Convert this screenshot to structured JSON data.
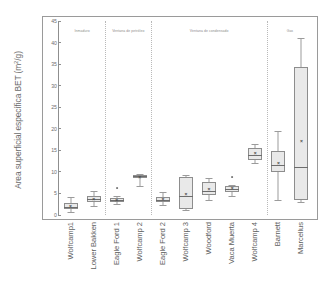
{
  "chart_data": {
    "type": "box",
    "title": "",
    "xlabel": "",
    "ylabel": "Area superficial específica BET (m²/g)",
    "ylabel_main": "Area superficial específica BET (m",
    "ylabel_sup": "2",
    "ylabel_tail": "/g)",
    "ylim": [
      0,
      45
    ],
    "ytick_labels": [
      "45",
      "40",
      "35",
      "30",
      "25",
      "20",
      "15",
      "10",
      "5",
      "0"
    ],
    "ytick_values": [
      45,
      40,
      35,
      30,
      25,
      20,
      15,
      10,
      5,
      0
    ],
    "grid": false,
    "legend": "none",
    "categories": [
      "Wolfcamp1",
      "Lower Bakken",
      "Eagle Ford 1",
      "Wolfcamp 2",
      "Eagle Ford 2",
      "Wolfcamp 3",
      "Woodford",
      "Vaca Muerta",
      "Wolfcamp 4",
      "Barnett",
      "Marcellus"
    ],
    "groups": [
      {
        "label": "Inmaduro",
        "start": 0,
        "end": 1
      },
      {
        "label": "Ventana de petróleo",
        "start": 2,
        "end": 3
      },
      {
        "label": "Ventana de condensado",
        "start": 4,
        "end": 8
      },
      {
        "label": "Gas",
        "start": 9,
        "end": 10
      }
    ],
    "boxes": [
      {
        "category": "Wolfcamp1",
        "whisker_low": 0.8,
        "q1": 1.3,
        "median": 1.9,
        "mean": 2.0,
        "q3": 2.7,
        "whisker_high": 4.2,
        "outliers": []
      },
      {
        "category": "Lower Bakken",
        "whisker_low": 2.2,
        "q1": 3.1,
        "median": 3.6,
        "mean": 3.8,
        "q3": 4.3,
        "whisker_high": 5.6,
        "outliers": []
      },
      {
        "category": "Eagle Ford 1",
        "whisker_low": 2.6,
        "q1": 3.0,
        "median": 3.4,
        "mean": 3.5,
        "q3": 3.9,
        "whisker_high": 4.3,
        "outliers": [
          6.2
        ]
      },
      {
        "category": "Wolfcamp 2",
        "whisker_low": 6.8,
        "q1": 8.6,
        "median": 9.0,
        "mean": 8.8,
        "q3": 9.3,
        "whisker_high": 9.6,
        "outliers": []
      },
      {
        "category": "Eagle Ford 2",
        "whisker_low": 2.3,
        "q1": 3.0,
        "median": 3.5,
        "mean": 3.6,
        "q3": 4.2,
        "whisker_high": 5.3,
        "outliers": []
      },
      {
        "category": "Wolfcamp 3",
        "whisker_low": 1.1,
        "q1": 1.3,
        "median": 4.4,
        "mean": 4.8,
        "q3": 8.9,
        "whisker_high": 9.3,
        "outliers": []
      },
      {
        "category": "Woodford",
        "whisker_low": 3.5,
        "q1": 4.6,
        "median": 5.6,
        "mean": 6.1,
        "q3": 7.7,
        "whisker_high": 8.5,
        "outliers": []
      },
      {
        "category": "Vaca Muerta",
        "whisker_low": 4.5,
        "q1": 5.4,
        "median": 6.1,
        "mean": 6.3,
        "q3": 6.7,
        "whisker_high": 7.0,
        "outliers": [
          8.8
        ]
      },
      {
        "category": "Wolfcamp 4",
        "whisker_low": 12.0,
        "q1": 12.8,
        "median": 13.9,
        "mean": 14.4,
        "q3": 15.6,
        "whisker_high": 16.4,
        "outliers": []
      },
      {
        "category": "Barnett",
        "whisker_low": 3.4,
        "q1": 9.9,
        "median": 11.7,
        "mean": 12.0,
        "q3": 14.9,
        "whisker_high": 19.4,
        "outliers": []
      },
      {
        "category": "Marcellus",
        "whisker_low": 3.1,
        "q1": 3.5,
        "median": 11.1,
        "mean": 17.1,
        "q3": 34.4,
        "whisker_high": 41.0,
        "outliers": []
      }
    ],
    "mean_marker": "×"
  },
  "colors": {
    "box_fill": "#e9e9e9",
    "box_stroke": "#8d8d8d",
    "whisker": "#9b9b9b",
    "frame": "#9a9a9a",
    "text": "#5e5e5e",
    "divider": "#b9b9b9"
  }
}
